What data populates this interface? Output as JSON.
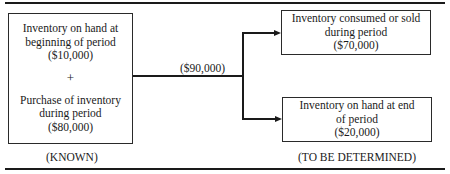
{
  "diagram": {
    "type": "flow",
    "left_box": {
      "top_group": {
        "lines": [
          "Inventory on hand at",
          "beginning of period",
          "($10,000)"
        ]
      },
      "operator": "+",
      "bottom_group": {
        "lines": [
          "Purchase of inventory",
          "during period",
          "($80,000)"
        ]
      }
    },
    "flow_label": "($90,000)",
    "right_top_box": {
      "lines": [
        "Inventory consumed or sold",
        "during period",
        "($70,000)"
      ]
    },
    "right_bottom_box": {
      "lines": [
        "Inventory on hand at end",
        "of period",
        "($20,000)"
      ]
    },
    "captions": {
      "left": "(KNOWN)",
      "right": "(TO BE DETERMINED)"
    },
    "values": {
      "beginning_inventory": 10000,
      "purchases": 80000,
      "goods_available": 90000,
      "consumed_or_sold": 70000,
      "ending_inventory": 20000
    }
  }
}
